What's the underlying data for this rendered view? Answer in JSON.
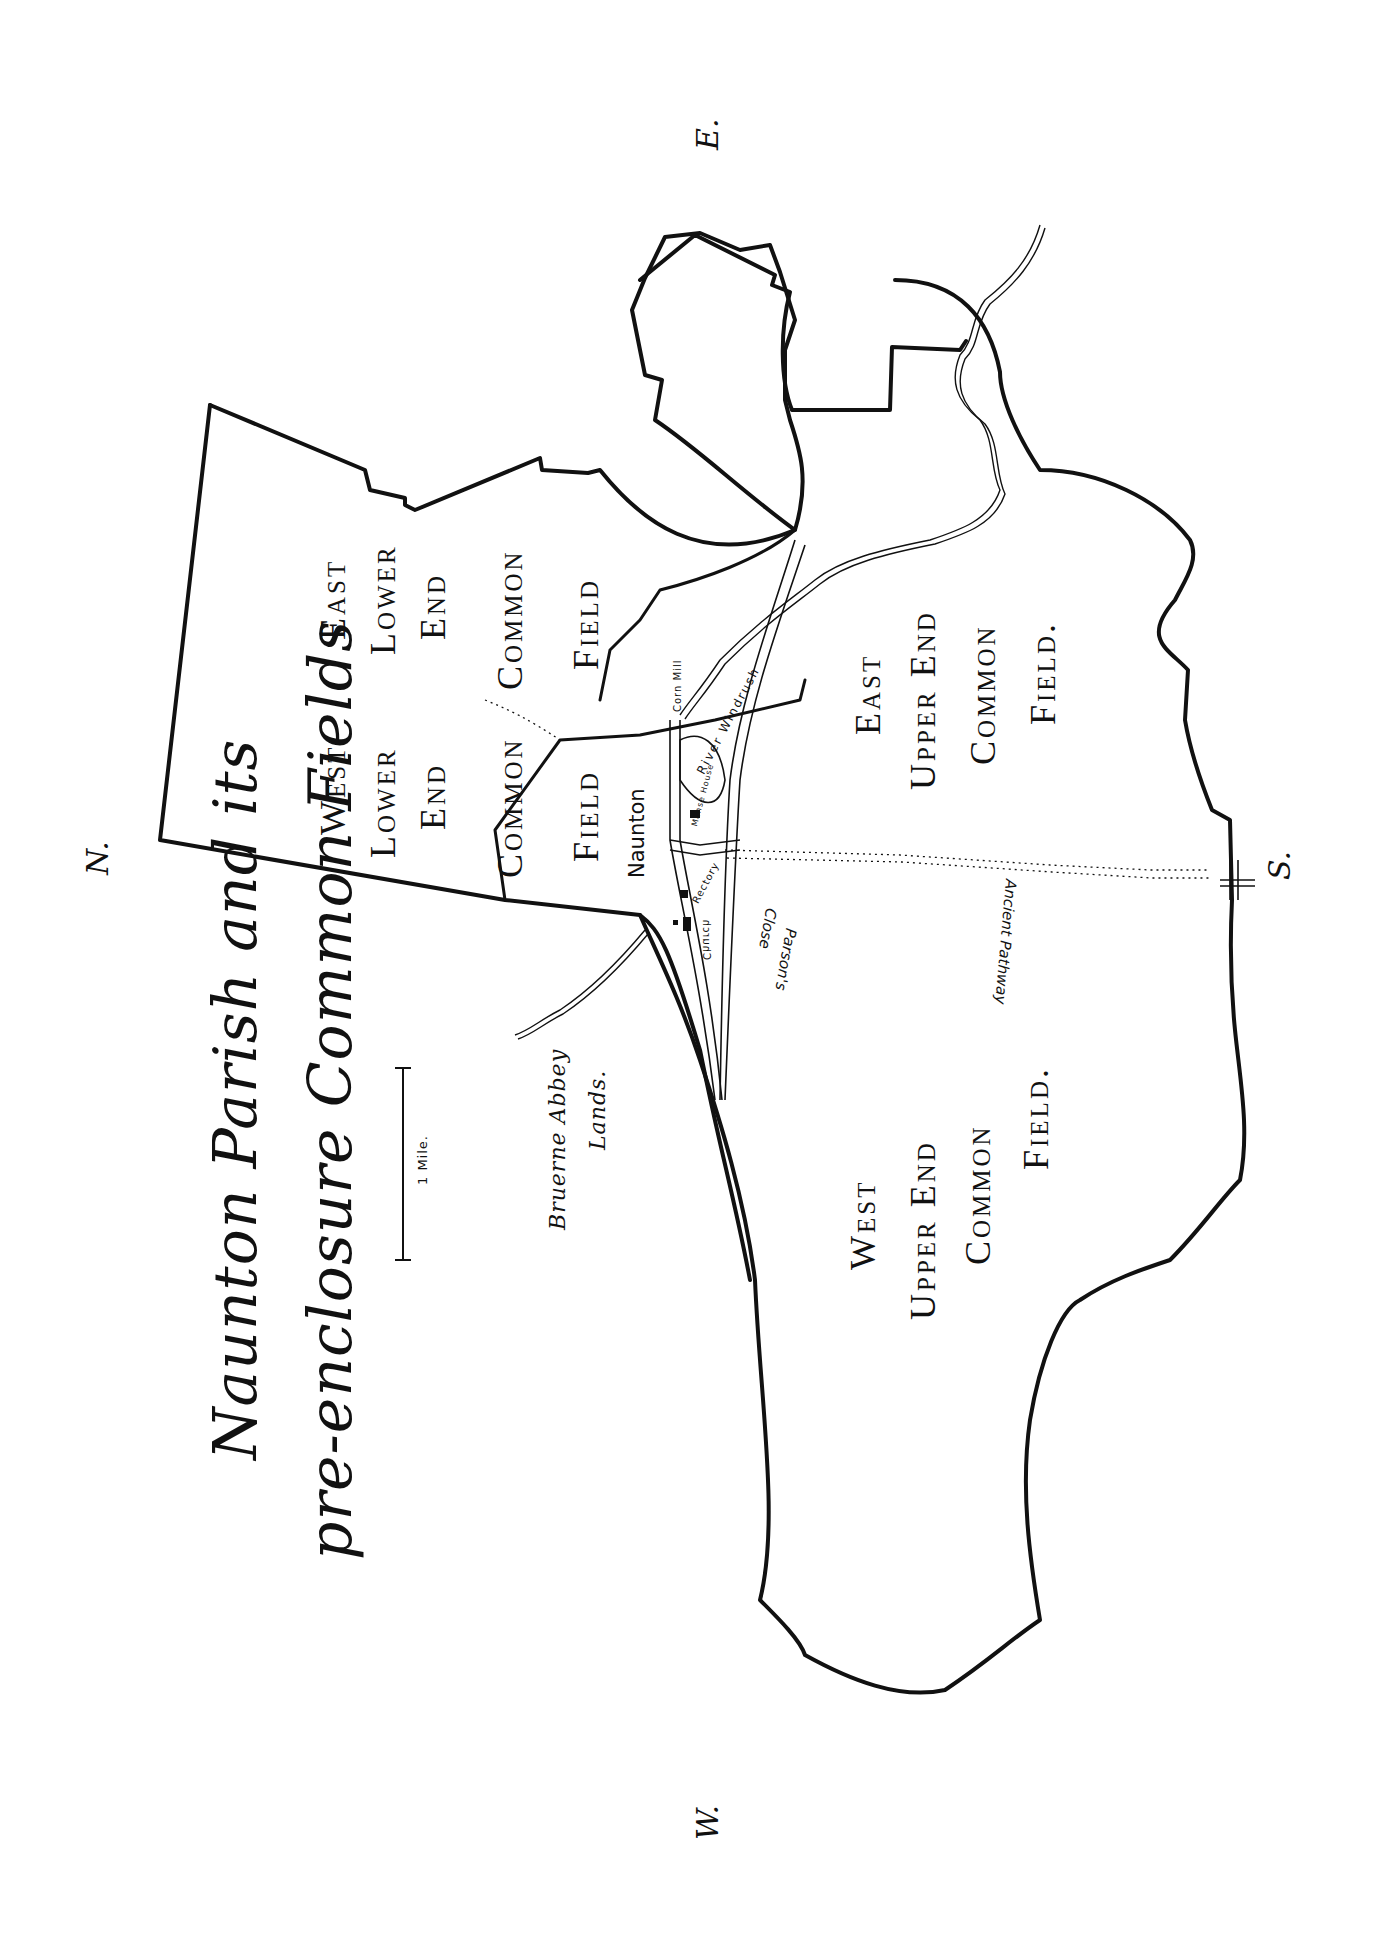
{
  "title": {
    "line1": "Naunton Parish and its",
    "line2": "pre-enclosure Common Fields"
  },
  "scale_bar": {
    "label": "1 Mile."
  },
  "compass": {
    "north": "N.",
    "south": "S.",
    "east": "E.",
    "west": "W."
  },
  "fields": {
    "west_lower": [
      "West",
      "Lower",
      "End",
      "Common",
      "Field"
    ],
    "east_lower": [
      "East",
      "Lower",
      "End",
      "Common",
      "Field"
    ],
    "east_upper": [
      "East",
      "Upper End",
      "Common",
      "Field."
    ],
    "west_upper": [
      "West",
      "Upper End",
      "Common",
      "Field."
    ]
  },
  "places": {
    "village": "Naunton",
    "river": "River Windrush",
    "mill": "Corn Mill",
    "manse": "Manse House",
    "rectory": "Rectory",
    "church": "Church",
    "parsons_close_1": "Parson's",
    "parsons_close_2": "Close",
    "pathway": "Ancient Pathway",
    "abbey_1": "Bruerne Abbey",
    "abbey_2": "Lands."
  },
  "colors": {
    "ink": "#111111",
    "paper": "#ffffff"
  }
}
